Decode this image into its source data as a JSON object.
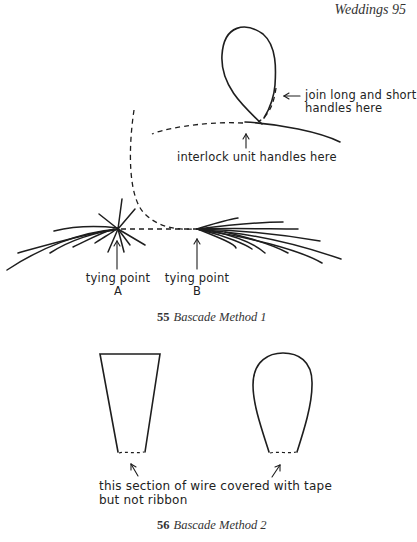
{
  "header": {
    "running_title": "Weddings 95"
  },
  "figure_55": {
    "labels": {
      "join": [
        "join long and short",
        "handles here"
      ],
      "interlock": "interlock unit handles here",
      "tying_a": [
        "tying point",
        "A"
      ],
      "tying_b": [
        "tying point",
        "B"
      ]
    },
    "caption": {
      "number": "55",
      "title": "Bascade Method 1"
    }
  },
  "figure_56": {
    "labels": {
      "note": [
        "this section of wire covered with tape",
        "but not ribbon"
      ]
    },
    "caption": {
      "number": "56",
      "title": "Bascade Method 2"
    }
  }
}
